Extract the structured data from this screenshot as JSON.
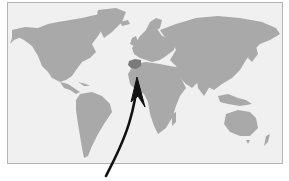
{
  "map": {
    "type": "world-map",
    "projection": "miller-like",
    "highlighted_region": "Spain",
    "colors": {
      "ocean": "#f0f0f0",
      "land": "#a9a9a9",
      "highlight": "#7a7a7a",
      "arrow": "#111111",
      "frame_border": "#b4b4b4"
    },
    "annotation": {
      "type": "arrow",
      "points_to": "Spain / Strait of Gibraltar"
    }
  }
}
